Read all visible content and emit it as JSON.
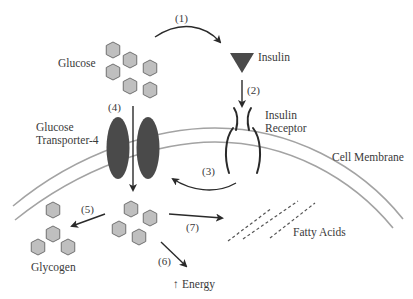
{
  "diagram": {
    "labels": {
      "glucose": "Glucose",
      "insulin": "Insulin",
      "insulin_receptor_line1": "Insulin",
      "insulin_receptor_line2": "Receptor",
      "glut4_line1": "Glucose",
      "glut4_line2": "Transporter-4",
      "cell_membrane": "Cell Membrane",
      "fatty_acids": "Fatty Acids",
      "glycogen": "Glycogen",
      "energy": "Energy",
      "energy_arrow": "↑"
    },
    "steps": {
      "s1": "(1)",
      "s2": "(2)",
      "s3": "(3)",
      "s4": "(4)",
      "s5": "(5)",
      "s6": "(6)",
      "s7": "(7)"
    },
    "colors": {
      "glucose_fill": "#bfbfbf",
      "glucose_stroke": "#6a6a6a",
      "insulin": "#4a4a4a",
      "transporter": "#4a4a4a",
      "membrane": "#a3a3a3",
      "arrows": "#2a2a2a"
    }
  }
}
